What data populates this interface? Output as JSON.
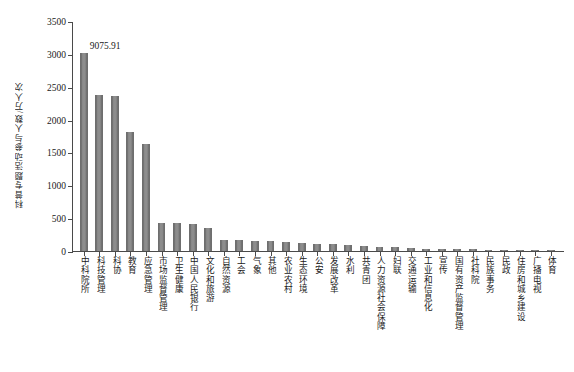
{
  "chart_data": {
    "type": "bar",
    "title": "",
    "xlabel": "",
    "ylabel": "科普专题活动参与人数/万人次",
    "ylim": [
      0,
      3500
    ],
    "ytick_values": [
      0,
      500,
      1000,
      1500,
      2000,
      2500,
      3000,
      3500
    ],
    "ytick_labels": [
      "0",
      "500",
      "1000",
      "1500",
      "2000",
      "2500",
      "3000",
      "3500"
    ],
    "grid": false,
    "legend": null,
    "bar_color": "#7b7b7b",
    "annotations": [
      {
        "text": "9075.91",
        "category": "中科院所",
        "note": "实际值超出坐标轴上限，柱形被截断"
      }
    ],
    "categories": [
      "中科院所",
      "科技管理",
      "科协",
      "教育",
      "应急管理",
      "市场监督管理",
      "卫生健康",
      "中国人民银行",
      "文化和旅游",
      "自然资源",
      "工会",
      "气象",
      "其他",
      "农业农村",
      "生态环境",
      "公安",
      "发展改革",
      "水利",
      "共青团",
      "人力资源社会保障",
      "妇联",
      "交通运输",
      "工业和信息化",
      "宣传",
      "国有资产监督管理",
      "社科院",
      "民族事务",
      "民政",
      "住房和城乡建设",
      "广播电视",
      "体育"
    ],
    "values": [
      3020,
      2380,
      2360,
      1810,
      1625,
      430,
      425,
      415,
      350,
      175,
      168,
      150,
      145,
      130,
      118,
      112,
      100,
      92,
      80,
      62,
      55,
      40,
      36,
      32,
      28,
      25,
      22,
      20,
      17,
      14,
      12
    ],
    "displayed_values": [
      "9075.91"
    ]
  }
}
